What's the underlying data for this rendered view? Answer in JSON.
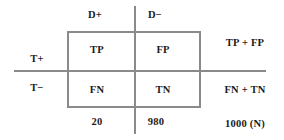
{
  "diagram": {
    "line_color": "#8a8a8a",
    "text_color": "#1a1a1a",
    "background": "#ffffff",
    "column_headers": [
      {
        "id": "disease-positive",
        "label": "D+"
      },
      {
        "id": "disease-negative",
        "label": "D−"
      }
    ],
    "row_headers": [
      {
        "id": "test-positive",
        "label": "T+"
      },
      {
        "id": "test-negative",
        "label": "T−"
      }
    ],
    "cells": [
      {
        "id": "true-positive",
        "label": "TP"
      },
      {
        "id": "false-positive",
        "label": "FP"
      },
      {
        "id": "false-negative",
        "label": "FN"
      },
      {
        "id": "true-negative",
        "label": "TN"
      }
    ],
    "row_totals": [
      {
        "id": "row-total-positive",
        "label": "TP + FP"
      },
      {
        "id": "row-total-negative",
        "label": "FN + TN"
      }
    ],
    "column_totals": [
      {
        "id": "col-total-disease-positive",
        "value": "20"
      },
      {
        "id": "col-total-disease-negative",
        "value": "980"
      }
    ],
    "grand_total": {
      "id": "grand-total",
      "value": "1000 (N)"
    }
  }
}
